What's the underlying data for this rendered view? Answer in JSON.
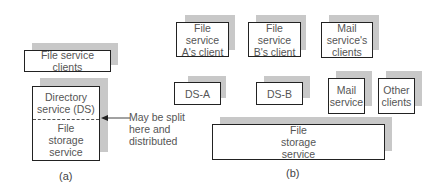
{
  "panel_a": {
    "label": "(a)",
    "clients_box": "File service clients",
    "directory_service": "Directory\nservice (DS)",
    "file_storage": "File\nstorage\nservice",
    "annotation": "May be split\nhere and\ndistributed"
  },
  "panel_b": {
    "label": "(b)",
    "top_row": [
      "File service\nA's client",
      "File service\nB's client",
      "Mail\nservice's\nclients"
    ],
    "middle_row": [
      "DS-A",
      "DS-B",
      "Mail\nservice",
      "Other\nclients"
    ],
    "file_storage": "File\nstorage\nservice"
  },
  "colors": {
    "shadow": "#c8c8c8",
    "border": "#222222",
    "text": "#555555"
  }
}
